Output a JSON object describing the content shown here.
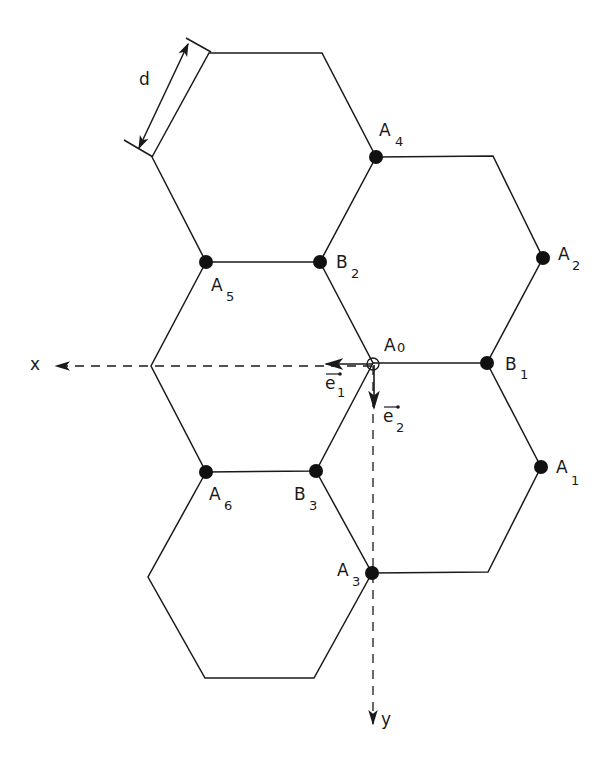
{
  "diagram": {
    "title": "",
    "edge_color": "#1a1a1a",
    "background": "#ffffff",
    "dimension_label": "d",
    "axes": {
      "x": {
        "label": "x"
      },
      "y": {
        "label": "y"
      }
    },
    "vectors": {
      "e1": {
        "base": "e",
        "sub": "1"
      },
      "e2": {
        "base": "e",
        "sub": "2"
      }
    },
    "points": {
      "A0": {
        "base": "A",
        "sub": "0"
      },
      "A1": {
        "base": "A",
        "sub": "1"
      },
      "A2": {
        "base": "A",
        "sub": "2"
      },
      "A3": {
        "base": "A",
        "sub": "3"
      },
      "A4": {
        "base": "A",
        "sub": "4"
      },
      "A5": {
        "base": "A",
        "sub": "5"
      },
      "A6": {
        "base": "A",
        "sub": "6"
      },
      "B1": {
        "base": "B",
        "sub": "1"
      },
      "B2": {
        "base": "B",
        "sub": "2"
      },
      "B3": {
        "base": "B",
        "sub": "3"
      }
    }
  }
}
